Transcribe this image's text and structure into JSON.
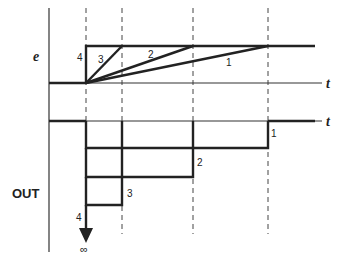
{
  "diagram": {
    "input_label": "e",
    "output_label": "OUT",
    "time_label_top": "t",
    "time_label_bottom": "t",
    "infinity_symbol": "∞",
    "curves": [
      {
        "id": "1",
        "label": "1",
        "rise_time_order": 4
      },
      {
        "id": "2",
        "label": "2",
        "rise_time_order": 3
      },
      {
        "id": "3",
        "label": "3",
        "rise_time_order": 2
      },
      {
        "id": "4",
        "label": "4",
        "rise_time_order": 1
      }
    ],
    "outputs": [
      {
        "id": "1",
        "label": "1",
        "amplitude_order": 1
      },
      {
        "id": "2",
        "label": "2",
        "amplitude_order": 2
      },
      {
        "id": "3",
        "label": "3",
        "amplitude_order": 3
      },
      {
        "id": "4",
        "label": "4",
        "amplitude_order": "infinite"
      }
    ]
  }
}
